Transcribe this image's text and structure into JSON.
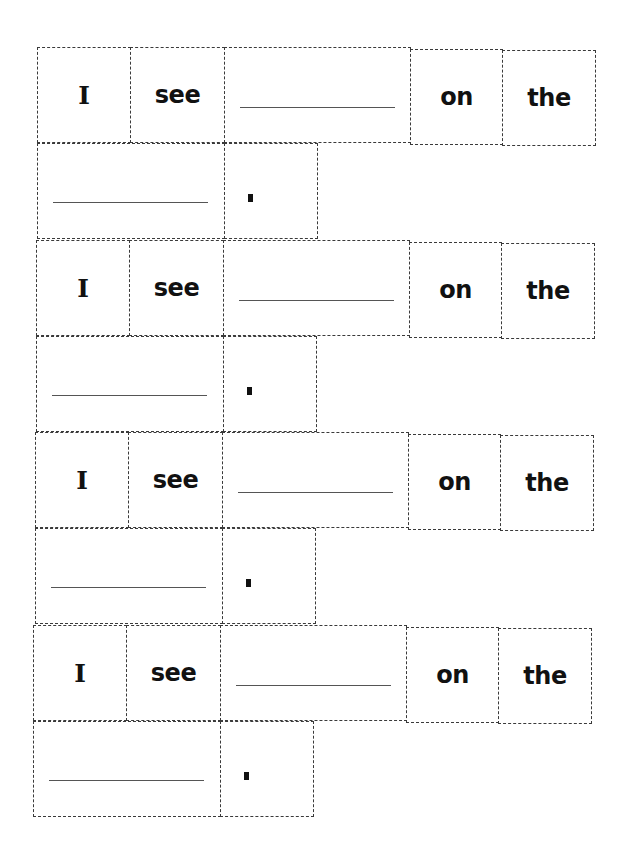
{
  "worksheet": {
    "sentences": [
      {
        "words": [
          "I",
          "see",
          "",
          "on",
          "the",
          "",
          "."
        ]
      },
      {
        "words": [
          "I",
          "see",
          "",
          "on",
          "the",
          "",
          "."
        ]
      },
      {
        "words": [
          "I",
          "see",
          "",
          "on",
          "the",
          "",
          "."
        ]
      },
      {
        "words": [
          "I",
          "see",
          "",
          "on",
          "the",
          "",
          "."
        ]
      }
    ],
    "labels": {
      "word_i": "I",
      "word_see": "see",
      "word_on": "on",
      "word_the": "the"
    },
    "colors": {
      "border": "#3a3a3a",
      "text": "#111111",
      "background": "#ffffff"
    }
  }
}
